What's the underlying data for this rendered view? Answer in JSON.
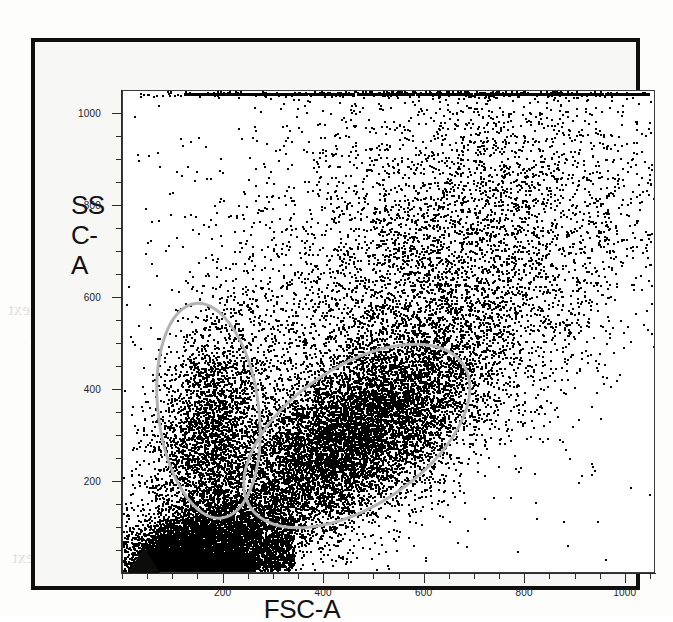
{
  "figure": {
    "kind": "flow-cytometry-scatter",
    "frame_color": "#100f0d",
    "paper_color": "#f7f7f5",
    "plot_background": "#ffffff"
  },
  "y_axis": {
    "title_lines": [
      "SS",
      "C-",
      "A"
    ],
    "title_text": "SSC-A",
    "ticks": [
      "1000",
      "800",
      "600",
      "400",
      "200"
    ],
    "tick_values": [
      1000,
      800,
      600,
      400,
      200
    ],
    "range": [
      0,
      1050
    ]
  },
  "x_axis": {
    "title_text": "FSC-A",
    "ticks": [
      "200",
      "400",
      "600",
      "800",
      "1000"
    ],
    "tick_values": [
      200,
      400,
      600,
      800,
      1000
    ],
    "range": [
      0,
      1060
    ]
  },
  "gates": [
    {
      "name": "lymphocyte-gate",
      "label": "left-vertical-gate",
      "color": "#b3b3b3",
      "cx": 170,
      "cy": 355,
      "rx": 100,
      "ry": 235,
      "rotation": -7
    },
    {
      "name": "monocyte-granulocyte-gate",
      "label": "right-tilted-gate",
      "color": "#b3b3b3",
      "cx": 465,
      "cy": 300,
      "rx": 255,
      "ry": 150,
      "rotation": -34
    }
  ],
  "markers": [
    {
      "name": "origin-triangle",
      "shape": "triangle",
      "color": "#0c0c0b",
      "x": 50,
      "y": 25
    }
  ],
  "chart_data": {
    "type": "scatter",
    "title": "",
    "xlabel": "FSC-A",
    "ylabel": "SSC-A",
    "xlim": [
      0,
      1060
    ],
    "ylim": [
      0,
      1050
    ],
    "grid": false,
    "legend": "none",
    "point_color": "#000000",
    "point_size_px": 2,
    "total_events_approx": 22000,
    "annotations": [
      "saturated event row along top edge at SSC-A max",
      "dense debris wedge hugging lower-left corner",
      "black triangle marker at lower-left origin"
    ],
    "populations": [
      {
        "name": "lymphocytes",
        "x_mean": 175,
        "y_mean": 300,
        "x_sd": 62,
        "y_sd": 135,
        "correlation": 0.25,
        "n": 3200,
        "gated_by": "lymphocyte-gate"
      },
      {
        "name": "monocytes-granulocytes",
        "x_mean": 455,
        "y_mean": 300,
        "x_sd": 130,
        "y_sd": 120,
        "correlation": 0.62,
        "n": 9000,
        "gated_by": "monocyte-granulocyte-gate"
      },
      {
        "name": "high-scatter-diffuse",
        "x_mean": 640,
        "y_mean": 640,
        "x_sd": 210,
        "y_sd": 230,
        "correlation": 0.45,
        "n": 5200,
        "gated_by": "none"
      },
      {
        "name": "debris",
        "x_mean": 120,
        "y_mean": 60,
        "x_sd": 95,
        "y_sd": 55,
        "correlation": 0.55,
        "n": 3600,
        "gated_by": "none"
      },
      {
        "name": "sparse-background",
        "x_mean": 560,
        "y_mean": 800,
        "x_sd": 300,
        "y_sd": 190,
        "correlation": 0.1,
        "n": 900,
        "gated_by": "none"
      },
      {
        "name": "top-saturation-row",
        "x_mean": 600,
        "y_mean": 1045,
        "x_sd": 290,
        "y_sd": 4,
        "correlation": 0.0,
        "n": 420,
        "gated_by": "none"
      }
    ]
  },
  "bleedthrough": {
    "line_a": "mid-page reverse text",
    "line_b": "reverse column text",
    "line_c": "reverse caption text"
  }
}
